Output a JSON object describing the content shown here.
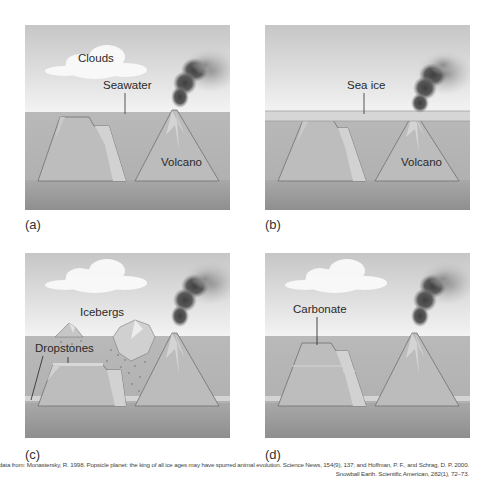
{
  "figure": {
    "panels": [
      {
        "id": "a",
        "label": "(a)",
        "annotations": {
          "clouds": "Clouds",
          "seawater": "Seawater",
          "volcano": "Volcano"
        }
      },
      {
        "id": "b",
        "label": "(b)",
        "annotations": {
          "sea_ice": "Sea ice",
          "volcano": "Volcano"
        }
      },
      {
        "id": "c",
        "label": "(c)",
        "annotations": {
          "icebergs": "Icebergs",
          "dropstones": "Dropstones"
        }
      },
      {
        "id": "d",
        "label": "(d)",
        "annotations": {
          "carbonate": "Carbonate"
        }
      }
    ],
    "citation": {
      "line1": "(a–d) data from: Monastersky, R. 1998. Popsicle planet: the king of all ice ages may have spurred animal evolution. Science News, 154(9), 137; and Hoffman, P. F., and Schrag, D. P. 2000.",
      "line2": "Snowball Earth. Scientific American, 282(1), 72–73."
    },
    "colors": {
      "sky_top": "#c9c9c9",
      "sky_bottom": "#f2f2f2",
      "sea": "#b3b3b3",
      "sea_deep": "#9c9c9c",
      "outline": "#6e6e6e",
      "smoke": "#4a4a4a",
      "ice": "#dcdcdc"
    }
  }
}
